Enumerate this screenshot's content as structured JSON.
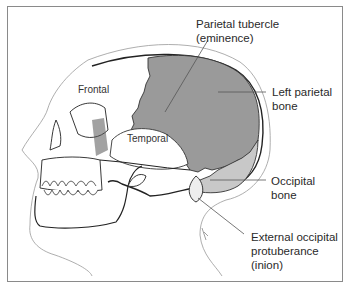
{
  "figure": {
    "type": "anatomical-illustration",
    "colors": {
      "frame": "#8a8a8a",
      "parietal_fill": "#9a9a9a",
      "occipital_fill": "#c8c8c8",
      "line": "#222222",
      "leader": "#555555"
    }
  },
  "labels": {
    "frontal": "Frontal",
    "temporal": "Temporal",
    "parietal_tubercle_line1": "Parietal tubercle",
    "parietal_tubercle_line2": "(eminence)",
    "left_parietal_line1": "Left parietal",
    "left_parietal_line2": "bone",
    "occipital_line1": "Occipital",
    "occipital_line2": "bone",
    "inion_line1": "External occipital",
    "inion_line2": "protuberance",
    "inion_line3": "(inion)"
  }
}
